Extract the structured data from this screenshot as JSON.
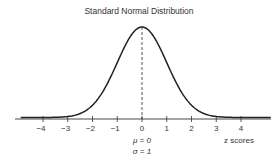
{
  "chart_data": {
    "type": "line",
    "title": "Standard Normal Distribution",
    "xlabel": "z scores",
    "ylabel": "",
    "x_ticks": [
      -4,
      -3,
      -2,
      -1,
      0,
      1,
      2,
      3,
      4
    ],
    "x_tick_labels": [
      "−4",
      "−3",
      "−2",
      "−1",
      "0",
      "1",
      "2",
      "3",
      "4"
    ],
    "xlim": [
      -4.9,
      5.2
    ],
    "grid": false,
    "legend": null,
    "annotations": {
      "mean_line": {
        "x": 0,
        "style": "dashed"
      },
      "mu_label": "μ = 0",
      "sigma_label": "σ = 1"
    },
    "series": [
      {
        "name": "standard normal pdf",
        "function": "exp(-z^2/2)/sqrt(2*pi)",
        "x": [
          -4.9,
          -4,
          -3,
          -2,
          -1,
          0,
          1,
          2,
          3,
          4,
          4.9
        ],
        "values": [
          0.0,
          0.0001,
          0.0044,
          0.054,
          0.242,
          0.3989,
          0.242,
          0.054,
          0.0044,
          0.0001,
          0.0
        ]
      }
    ]
  },
  "colors": {
    "curve": "#222222",
    "axis": "#333333",
    "text": "#333333"
  }
}
